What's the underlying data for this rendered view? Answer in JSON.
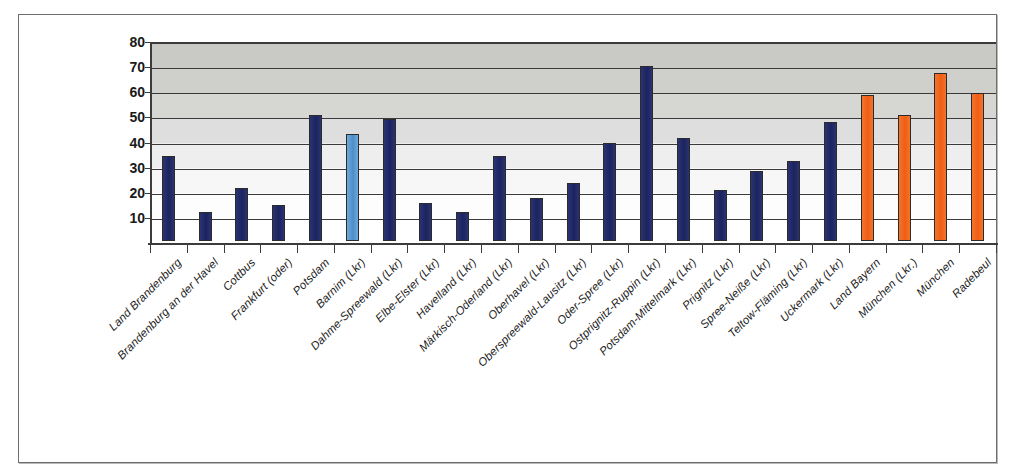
{
  "chart_data": {
    "type": "bar",
    "title": "",
    "subtitle": "",
    "xlabel": "",
    "ylabel": "",
    "ylim": [
      0,
      80
    ],
    "yticks": [
      10,
      20,
      30,
      40,
      50,
      60,
      70,
      80
    ],
    "grid": true,
    "legend": "none",
    "categories": [
      "Land Brandenburg",
      "Brandenburg an der Havel",
      "Cottbus",
      "Frankfurt (oder)",
      "Potsdam",
      "Barnim (Lkr)",
      "Dahme-Spreewald (Lkr)",
      "Elbe-Elster (Lkr)",
      "Havelland (Lkr)",
      "Märkisch-Oderland (Lkr)",
      "Oberhavel (Lkr)",
      "Oberspreewald-Lausitz (Lkr)",
      "Oder-Spree (Lkr)",
      "Ostprignitz-Ruppin (Lkr)",
      "Potsdam-Mittelmark (Lkr)",
      "Prignitz (Lkr)",
      "Spree-Neiße (Lkr)",
      "Teltow-Fläming (Lkr)",
      "Uckermark (Lkr)",
      "Land Bayern",
      "München (Lkr.)",
      "München",
      "Radebeul"
    ],
    "values": [
      34,
      11.5,
      21,
      14.5,
      50,
      42.5,
      48.5,
      15,
      11.5,
      34,
      17,
      23,
      39,
      69.5,
      41,
      20.5,
      28,
      32,
      47.5,
      58,
      50,
      67,
      59
    ],
    "bar_colors": [
      "navy",
      "navy",
      "navy",
      "navy",
      "navy",
      "lightblue",
      "navy",
      "navy",
      "navy",
      "navy",
      "navy",
      "navy",
      "navy",
      "navy",
      "navy",
      "navy",
      "navy",
      "navy",
      "navy",
      "orange",
      "orange",
      "orange",
      "orange"
    ],
    "colors": {
      "navy": "#1f2a6b",
      "lightblue": "#5b9bd5",
      "orange": "#f26522",
      "gridline": "#3a3a3a",
      "plot_bg_top": "#c9c9c6",
      "plot_bg_bottom": "#ffffff",
      "frame_border": "#6d6d6d"
    }
  }
}
